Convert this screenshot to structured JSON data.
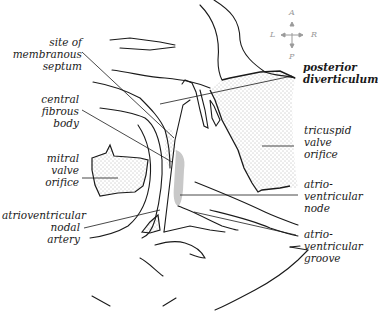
{
  "figure": {
    "type": "anatomical-illustration",
    "colors": {
      "line": "#1a1a1a",
      "stipple": "#6a6a6a",
      "node_shade": "#c8c8c8",
      "compass": "#9a9a9a"
    }
  },
  "compass": {
    "anterior": "A",
    "posterior": "P",
    "left": "L",
    "right": "R"
  },
  "labels_left": {
    "membranous_septum": "site of\nmembranous\nseptum",
    "central_fibrous_body": "central\nfibrous\nbody",
    "mitral_valve_orifice": "mitral\nvalve\norifice",
    "av_nodal_artery": "atrioventricular\nnodal\nartery"
  },
  "labels_right": {
    "posterior_diverticulum": "posterior\ndiverticulum",
    "tricuspid_valve_orifice": "tricuspid\nvalve\norifice",
    "av_node": "atrio-\nventricular\nnode",
    "av_groove": "atrio-\nventricular\ngroove"
  }
}
